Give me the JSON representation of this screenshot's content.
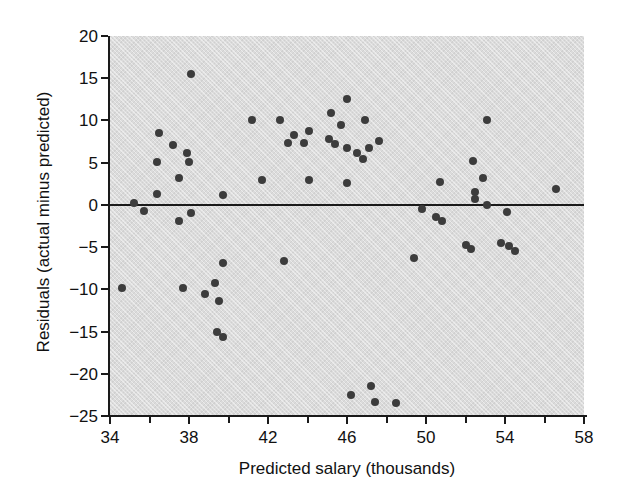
{
  "figure": {
    "background": "#ffffff",
    "plot_background": "#dbdbdb",
    "point_color": "#3c3c3c",
    "axis_color": "#1a1a1a",
    "text_color": "#111111"
  },
  "chart_data": {
    "type": "scatter",
    "title": "",
    "xlabel": "Predicted salary (thousands)",
    "ylabel": "Residuals (actual minus predicted)",
    "xlim": [
      34,
      58
    ],
    "ylim": [
      -25,
      20
    ],
    "x_major_ticks": [
      34,
      38,
      42,
      46,
      50,
      54,
      58
    ],
    "x_minor_ticks": [
      36,
      40,
      44,
      48,
      52,
      56
    ],
    "y_ticks": [
      20,
      15,
      10,
      5,
      0,
      -5,
      -10,
      -15,
      -20,
      -25
    ],
    "grid": false,
    "legend": false,
    "reference_line_y": 0,
    "points": [
      [
        38.1,
        15.5
      ],
      [
        46.0,
        12.5
      ],
      [
        45.2,
        10.9
      ],
      [
        41.2,
        10.1
      ],
      [
        42.6,
        10.1
      ],
      [
        46.9,
        10.0
      ],
      [
        53.1,
        10.0
      ],
      [
        45.7,
        9.5
      ],
      [
        44.1,
        8.8
      ],
      [
        36.5,
        8.5
      ],
      [
        43.3,
        8.3
      ],
      [
        45.1,
        7.8
      ],
      [
        47.6,
        7.6
      ],
      [
        43.0,
        7.3
      ],
      [
        43.8,
        7.3
      ],
      [
        45.4,
        7.2
      ],
      [
        37.2,
        7.1
      ],
      [
        46.0,
        6.7
      ],
      [
        47.1,
        6.7
      ],
      [
        37.9,
        6.2
      ],
      [
        46.5,
        6.1
      ],
      [
        46.8,
        5.4
      ],
      [
        52.4,
        5.2
      ],
      [
        36.4,
        5.1
      ],
      [
        38.0,
        5.1
      ],
      [
        37.5,
        3.2
      ],
      [
        52.9,
        3.2
      ],
      [
        44.1,
        3.0
      ],
      [
        41.7,
        2.9
      ],
      [
        50.7,
        2.7
      ],
      [
        46.0,
        2.6
      ],
      [
        56.6,
        1.9
      ],
      [
        52.5,
        1.5
      ],
      [
        36.4,
        1.3
      ],
      [
        39.7,
        1.2
      ],
      [
        52.5,
        0.7
      ],
      [
        35.2,
        0.2
      ],
      [
        53.1,
        0.0
      ],
      [
        49.8,
        -0.5
      ],
      [
        35.7,
        -0.7
      ],
      [
        54.1,
        -0.9
      ],
      [
        38.1,
        -1.0
      ],
      [
        50.5,
        -1.4
      ],
      [
        37.5,
        -1.9
      ],
      [
        50.8,
        -1.9
      ],
      [
        53.8,
        -4.5
      ],
      [
        52.0,
        -4.8
      ],
      [
        54.2,
        -4.9
      ],
      [
        52.3,
        -5.2
      ],
      [
        54.5,
        -5.5
      ],
      [
        49.4,
        -6.3
      ],
      [
        42.8,
        -6.7
      ],
      [
        39.7,
        -6.9
      ],
      [
        39.3,
        -9.2
      ],
      [
        34.6,
        -9.9
      ],
      [
        37.7,
        -9.9
      ],
      [
        38.8,
        -10.6
      ],
      [
        39.5,
        -11.4
      ],
      [
        39.4,
        -15.0
      ],
      [
        39.7,
        -15.6
      ],
      [
        47.2,
        -21.5
      ],
      [
        46.2,
        -22.5
      ],
      [
        47.4,
        -23.3
      ],
      [
        48.5,
        -23.5
      ]
    ]
  }
}
